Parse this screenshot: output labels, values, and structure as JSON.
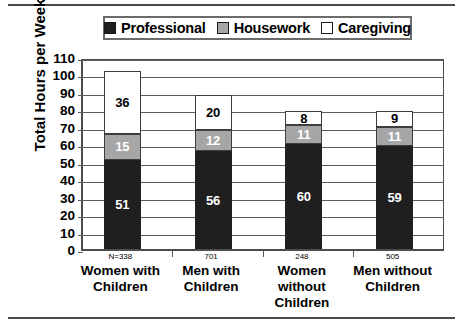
{
  "chart_data": {
    "type": "bar",
    "subtype": "stacked-bar",
    "title": "",
    "xlabel": "",
    "ylabel": "Total Hours per Week",
    "ylim": [
      0,
      110
    ],
    "ytick_step": 10,
    "yticks": [
      0,
      10,
      20,
      30,
      40,
      50,
      60,
      70,
      80,
      90,
      100,
      110
    ],
    "grid": true,
    "legend_position": "top",
    "categories": [
      "Women with Children",
      "Men with Children",
      "Women without Children",
      "Men without Children"
    ],
    "category_lines": [
      [
        "Women with",
        "Children"
      ],
      [
        "Men with",
        "Children"
      ],
      [
        "Women",
        "without",
        "Children"
      ],
      [
        "Men without",
        "Children"
      ]
    ],
    "sample_sizes": [
      "N=338",
      "701",
      "248",
      "505"
    ],
    "series": [
      {
        "name": "Professional",
        "color": "#201f1f",
        "values": [
          51,
          56,
          60,
          59
        ]
      },
      {
        "name": "Housework",
        "color": "#a6a6a6",
        "values": [
          15,
          12,
          11,
          11
        ]
      },
      {
        "name": "Caregiving",
        "color": "#ffffff",
        "values": [
          36,
          20,
          8,
          9
        ]
      }
    ],
    "totals": [
      102,
      88,
      79,
      79
    ]
  },
  "legend": {
    "items": [
      {
        "label": "Professional",
        "swatch": "#201f1f"
      },
      {
        "label": "Housework",
        "swatch": "#a6a6a6"
      },
      {
        "label": "Caregiving",
        "swatch": "#ffffff"
      }
    ]
  },
  "axis": {
    "y_title": "Total Hours per Week"
  }
}
